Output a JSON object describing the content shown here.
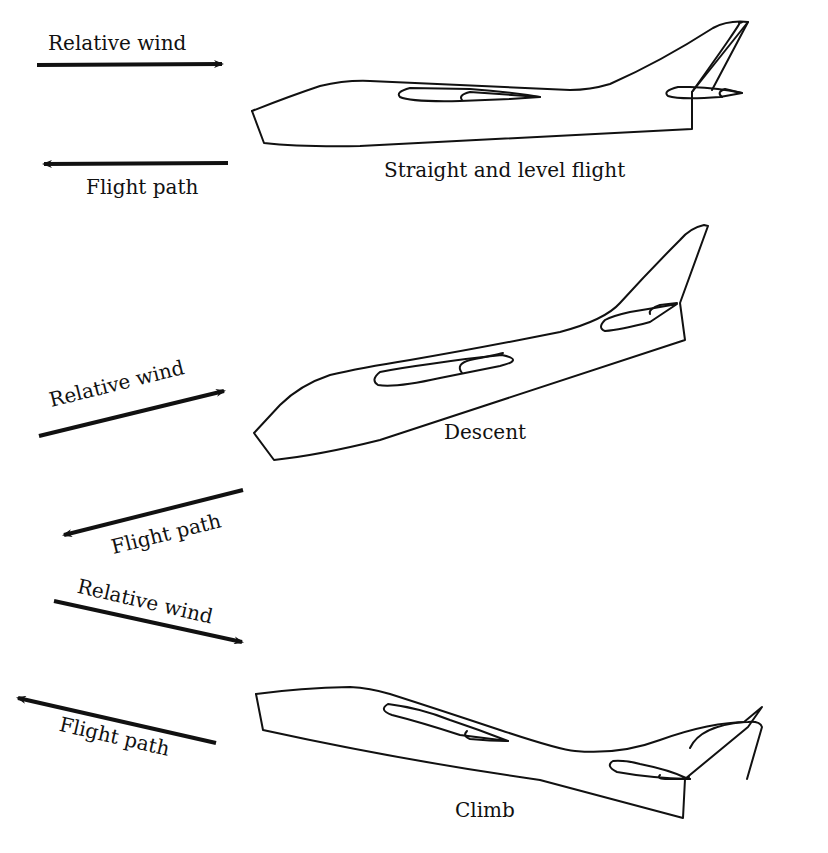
{
  "figure": {
    "panels": [
      {
        "id": "level",
        "caption": "Straight and level flight",
        "relative_wind_label": "Relative wind",
        "flight_path_label": "Flight path",
        "relative_wind_direction": "right",
        "flight_path_direction": "left"
      },
      {
        "id": "descent",
        "caption": "Descent",
        "relative_wind_label": "Relative wind",
        "flight_path_label": "Flight path",
        "relative_wind_direction": "up-right",
        "flight_path_direction": "down-left"
      },
      {
        "id": "climb",
        "caption": "Climb",
        "relative_wind_label": "Relative wind",
        "flight_path_label": "Flight path",
        "relative_wind_direction": "down-right",
        "flight_path_direction": "up-left"
      }
    ],
    "colors": {
      "line": "#111111",
      "background": "#ffffff"
    }
  }
}
